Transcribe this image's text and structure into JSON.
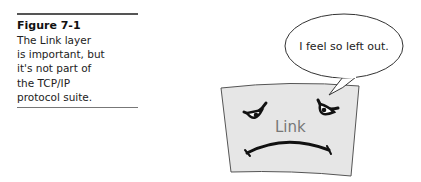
{
  "figure": {
    "label": "Figure 7-1",
    "caption_lines": [
      "The Link layer",
      "is important, but",
      "it's not part of",
      "the TCP/IP",
      "protocol suite."
    ]
  },
  "illustration": {
    "speech_bubble_text": "I feel so left out.",
    "character_label": "Link",
    "character_expression": "sad",
    "colors": {
      "flag_fill": "#e6e6e6",
      "outline": "#444444",
      "label": "#777777"
    }
  }
}
